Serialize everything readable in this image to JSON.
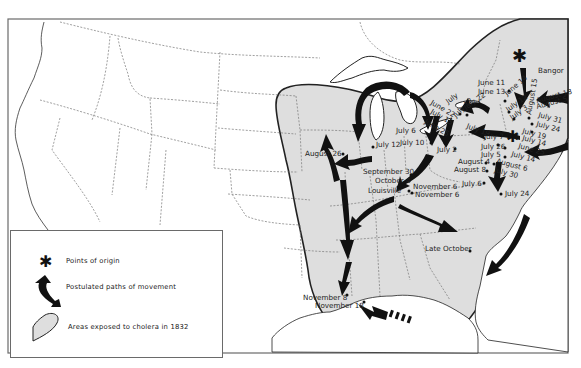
{
  "map": {
    "subject": "Spread of cholera in the United States, 1832",
    "colors": {
      "exposed_area": "#dedede",
      "arrow": "#111111",
      "border": "#777777",
      "background": "#ffffff"
    }
  },
  "legend": {
    "items": [
      {
        "icon": "asterisk-icon",
        "label": "Points of origin"
      },
      {
        "icon": "curved-arrow-icon",
        "label": "Postulated paths of movement"
      },
      {
        "icon": "shaded-area-icon",
        "label": "Areas exposed to cholera in 1832"
      }
    ]
  },
  "labels": {
    "bangor": "Bangor",
    "june_11": "June 11",
    "june_13": "June 13",
    "june_14": "June 14",
    "july_12_ny": "July 12",
    "july_3": "July 3",
    "august_15": "August 15",
    "august_18": "August 18",
    "august_5": "August 5",
    "july_31": "July 31",
    "july_24_ne": "July 24",
    "july_19_ne": "July 19",
    "july_14_ne": "July 14",
    "june_25_ne": "June 25",
    "july_a": "July",
    "june_22": "June 22",
    "july_15": "July 15",
    "july_22": "July 22",
    "june_25": "June 25",
    "july_12_b": "July 12",
    "july_19": "July 19",
    "july_7": "July 7",
    "july_26": "July 26",
    "july_5": "July 5",
    "july_14": "July 14",
    "august_4": "August 4",
    "august_6": "August 6",
    "august_8": "August 8",
    "july_30": "July 30",
    "july_6_va": "July 6",
    "july_24_va": "July 24",
    "july_6_mi": "July 6",
    "july_10": "July 10",
    "july_2": "July 2",
    "july_12_chi": "July 12",
    "august_26": "August 26",
    "september_30": "September 30",
    "october_4": "October 4",
    "louisville": "Louisville",
    "november_6_a": "November 6",
    "november_6_b": "November 6",
    "late_october": "Late October",
    "november_8": "November 8",
    "november_18": "November 18"
  }
}
